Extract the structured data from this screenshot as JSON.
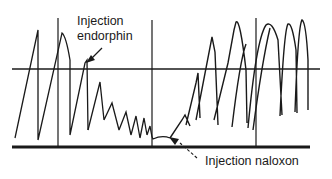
{
  "figure": {
    "type": "physiological recording trace",
    "background_color": "#ffffff",
    "line_color": "#1a1a1a",
    "annotations": [
      {
        "id": "endorphin",
        "lines": [
          "Injection",
          "endorphin"
        ],
        "arrow_target": "peak after second marker"
      },
      {
        "id": "naloxon",
        "lines": [
          "Injection naloxon"
        ],
        "arrow_target": "flat segment after middle marker"
      }
    ],
    "reference_line": {
      "y": 69,
      "x1": 12,
      "x2": 320
    },
    "baseline": {
      "y": 147,
      "x1": 12,
      "x2": 310
    },
    "markers_x": [
      58,
      152,
      256
    ]
  }
}
